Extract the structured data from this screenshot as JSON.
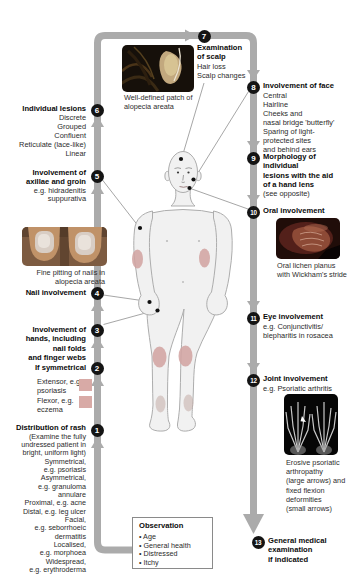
{
  "colors": {
    "flow_bar": "#ababab",
    "badge": "#141414",
    "rash_patch": "#d2a3a1",
    "swatch_pink": "#d8aaa6"
  },
  "steps": {
    "s1": {
      "num": "1",
      "title": "Distribution of rash",
      "items": [
        "(Examine the fully",
        "undressed patient in",
        "bright, uniform light)",
        "Symmetrical,",
        "e.g. psoriasis",
        "Asymmetrical,",
        "e.g. granuloma",
        "annulare",
        "Proximal, e.g. acne",
        "Distal, e.g. leg ulcer",
        "Facial,",
        "e.g. seborrhoeic",
        "dermatitis",
        "Localised,",
        "e.g. morphoea",
        "Widespread,",
        "e.g. erythroderma"
      ]
    },
    "s2": {
      "num": "2",
      "title": "If symmetrical",
      "items": [
        "Extensor, e.g.",
        "psoriasis",
        "Flexor, e.g.",
        "eczema"
      ]
    },
    "s3": {
      "num": "3",
      "title_lines": [
        "Involvement of",
        "hands, including",
        "nail folds",
        "and finger webs"
      ]
    },
    "s4": {
      "num": "4",
      "title": "Nail involvement"
    },
    "s5": {
      "num": "5",
      "title_lines": [
        "Involvement of",
        "axillae and groin"
      ],
      "items": [
        "e.g. hidradenitis",
        "suppurativa"
      ]
    },
    "s6": {
      "num": "6",
      "title": "Individual lesions",
      "items": [
        "Discrete",
        "Grouped",
        "Confluent",
        "Reticulate (lace-like)",
        "Linear"
      ]
    },
    "s7": {
      "num": "7",
      "title_lines": [
        "Examination",
        "of scalp"
      ],
      "items": [
        "Hair loss",
        "Scalp changes"
      ]
    },
    "s8": {
      "num": "8",
      "title": "Involvement of face",
      "items": [
        "Central",
        "Hairline",
        "Cheeks and",
        "nasal bridge 'butterfly'",
        "Sparing of light-",
        "protected sites",
        "and behind ears"
      ]
    },
    "s9": {
      "num": "9",
      "title_lines": [
        "Morphology of",
        "individual",
        "lesions with the aid",
        "of a hand lens"
      ],
      "note": "(see opposite)"
    },
    "s10": {
      "num": "10",
      "title": "Oral involvement",
      "caption": [
        "Oral lichen planus",
        "with Wickham's stride"
      ]
    },
    "s11": {
      "num": "11",
      "title": "Eye involvement",
      "items": [
        "e.g. Conjunctivitis/",
        "blepharitis in rosacea"
      ]
    },
    "s12": {
      "num": "12",
      "title": "Joint involvement",
      "items": [
        "e.g. Psoriatic arthritis"
      ],
      "caption": [
        "Erosive psoriatic",
        "arthropathy",
        "(large arrows) and",
        "fixed flexion",
        "deformities",
        "(small arrows)"
      ]
    },
    "s13": {
      "num": "13",
      "title_lines": [
        "General medical",
        "examination",
        "if indicated"
      ]
    }
  },
  "captions": {
    "scalp": [
      "Well-defined patch of",
      "alopecia areata"
    ],
    "nails": [
      "Fine pitting of nails in",
      "alopecia areata"
    ]
  },
  "observation": {
    "title": "Observation",
    "items": [
      "• Age",
      "• General health",
      "• Distressed",
      "• Itchy"
    ]
  }
}
